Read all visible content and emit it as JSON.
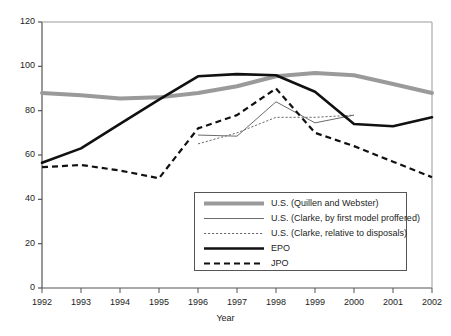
{
  "chart_data": {
    "type": "line",
    "title": "",
    "xlabel": "Year",
    "ylabel": "",
    "categories": [
      "1992",
      "1993",
      "1994",
      "1995",
      "1996",
      "1997",
      "1998",
      "1999",
      "2000",
      "2001",
      "2002"
    ],
    "x": [
      1992,
      1993,
      1994,
      1995,
      1996,
      1997,
      1998,
      1999,
      2000,
      2001,
      2002
    ],
    "xlim": [
      1992,
      2002
    ],
    "ylim": [
      0,
      120
    ],
    "yticks": [
      0,
      20,
      40,
      60,
      80,
      100,
      120
    ],
    "grid": false,
    "legend_position": "inside-bottom-center",
    "series": [
      {
        "name": "U.S. (Quillen and Webster)",
        "style": "thick-solid-gray",
        "color": "#9a9a9a",
        "values": [
          88,
          87,
          85.5,
          86,
          88,
          91,
          95.5,
          97,
          96,
          92,
          88
        ]
      },
      {
        "name": "U.S. (Clarke, by first model proffered)",
        "style": "thin-solid-gray",
        "color": "#6b6b6b",
        "values": [
          null,
          null,
          null,
          null,
          69,
          68.5,
          84,
          74.5,
          78,
          null,
          null
        ]
      },
      {
        "name": "U.S. (Clarke,  relative to disposals)",
        "style": "thin-dotted-gray",
        "color": "#6b6b6b",
        "values": [
          null,
          null,
          null,
          null,
          65,
          70,
          77,
          77,
          78,
          null,
          null
        ]
      },
      {
        "name": "EPO",
        "style": "thick-solid-black",
        "color": "#111111",
        "values": [
          56.5,
          63,
          74,
          85,
          95.5,
          96.5,
          96,
          88.5,
          74,
          73,
          77
        ]
      },
      {
        "name": "JPO",
        "style": "thick-dashed-black",
        "color": "#111111",
        "values": [
          54.5,
          55.5,
          53,
          49.5,
          72,
          78,
          90,
          70,
          64,
          57,
          50
        ]
      }
    ]
  },
  "axes": {
    "ytick_labels": [
      "0",
      "20",
      "40",
      "60",
      "80",
      "100",
      "120"
    ],
    "xtick_labels": [
      "1992",
      "1993",
      "1994",
      "1995",
      "1996",
      "1997",
      "1998",
      "1999",
      "2000",
      "2001",
      "2002"
    ],
    "xaxis_title": "Year"
  },
  "legend": {
    "entries": [
      {
        "label": "U.S. (Quillen and Webster)",
        "swatch": "thick-solid-gray-swatch"
      },
      {
        "label": "U.S. (Clarke, by first model proffered)",
        "swatch": "thin-solid-gray-swatch"
      },
      {
        "label": "U.S. (Clarke,  relative to disposals)",
        "swatch": "thin-dotted-gray-swatch"
      },
      {
        "label": "EPO",
        "swatch": "thick-solid-black-swatch"
      },
      {
        "label": "JPO",
        "swatch": "thick-dashed-black-swatch"
      }
    ]
  },
  "colors": {
    "axis": "#555555",
    "gray_series": "#9a9a9a",
    "thin_gray_series": "#6b6b6b",
    "black_series": "#111111",
    "background": "#ffffff"
  }
}
